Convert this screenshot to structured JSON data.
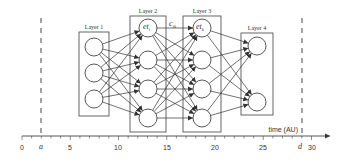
{
  "diagram": {
    "type": "neural-network-timeline",
    "layers": [
      {
        "name": "Layer 1",
        "nodes": 3
      },
      {
        "name": "Layer 2",
        "nodes": 4,
        "top_node_label": "et",
        "top_node_sub": "i"
      },
      {
        "name": "Layer 3",
        "nodes": 4,
        "top_node_label": "et",
        "top_node_sub": "k"
      },
      {
        "name": "Layer 4",
        "nodes": 2
      }
    ],
    "connection_label": "c",
    "connection_sub": "ik",
    "axis": {
      "title": "time (AU)",
      "ticks": [
        "0",
        "5",
        "10",
        "15",
        "20",
        "25",
        "30"
      ],
      "markers": [
        {
          "label": "a",
          "value": 2
        },
        {
          "label": "d",
          "value": 29
        }
      ]
    },
    "colors": {
      "line": "#333333",
      "box": "#555555",
      "background": "#ffffff"
    }
  }
}
